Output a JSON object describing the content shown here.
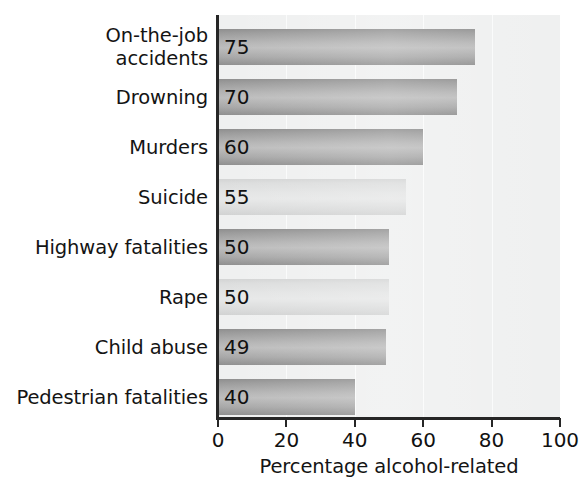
{
  "chart_data": {
    "type": "bar",
    "orientation": "horizontal",
    "title": "",
    "xlabel": "Percentage alcohol-related",
    "ylabel": "",
    "xlim": [
      0,
      100
    ],
    "xticks": [
      0,
      20,
      40,
      60,
      80,
      100
    ],
    "grid": false,
    "legend": "none",
    "categories": [
      "On-the-job\naccidents",
      "Drowning",
      "Murders",
      "Suicide",
      "Highway fatalities",
      "Rape",
      "Child abuse",
      "Pedestrian fatalities"
    ],
    "values": [
      75,
      70,
      60,
      55,
      50,
      50,
      49,
      40
    ],
    "value_labels": [
      "75",
      "70",
      "60",
      "55",
      "50",
      "50",
      "49",
      "40"
    ],
    "bar_shades": [
      "dark",
      "dark",
      "dark",
      "light",
      "dark",
      "light",
      "dark",
      "dark"
    ]
  },
  "axis": {
    "tick_labels": [
      "0",
      "20",
      "40",
      "60",
      "80",
      "100"
    ],
    "title": "Percentage alcohol-related"
  },
  "colors": {
    "plot_background": "#eff0f0",
    "axis_line": "#262626",
    "bar_dark": "#aeaeae",
    "bar_light": "#e2e3e3",
    "text": "#141414"
  }
}
